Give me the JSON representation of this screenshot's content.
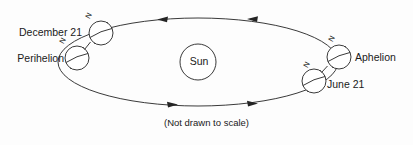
{
  "diagram": {
    "caption": "(Not drawn to scale)",
    "center_body": {
      "label": "Sun",
      "cx": 198,
      "cy": 62,
      "r": 18
    },
    "orbit": {
      "shape": "ellipse",
      "cx": 198,
      "cy": 62,
      "rx": 140,
      "ry": 44,
      "direction": "counterclockwise",
      "stroke_color": "#242424"
    },
    "arrows": [
      {
        "name": "top-arrow-left",
        "x": 163,
        "y": 19,
        "direction": "left"
      },
      {
        "name": "top-arrow-right",
        "x": 253,
        "y": 19,
        "direction": "left"
      },
      {
        "name": "bottom-arrow-left",
        "x": 172,
        "y": 103,
        "direction": "right"
      },
      {
        "name": "bottom-arrow-right",
        "x": 252,
        "y": 102,
        "direction": "right"
      }
    ],
    "earth_positions": [
      {
        "id": "december",
        "label": "December 21",
        "pole_label": "N",
        "cx": 101,
        "cy": 33,
        "r": 12,
        "tilt_deg": 23.5,
        "label_side": "left"
      },
      {
        "id": "perihelion",
        "label": "Perihelion",
        "pole_label": "N",
        "cx": 77,
        "cy": 58,
        "r": 12,
        "tilt_deg": 23.5,
        "label_side": "left"
      },
      {
        "id": "aphelion",
        "label": "Aphelion",
        "pole_label": "N",
        "cx": 339,
        "cy": 57,
        "r": 12,
        "tilt_deg": 23.5,
        "label_side": "right"
      },
      {
        "id": "june",
        "label": "June 21",
        "pole_label": "N",
        "cx": 314,
        "cy": 81,
        "r": 12,
        "tilt_deg": 23.5,
        "label_side": "right"
      }
    ],
    "colors": {
      "ink": "#242424",
      "background": "#fdfdfd",
      "text": "#1a1a1a"
    }
  }
}
